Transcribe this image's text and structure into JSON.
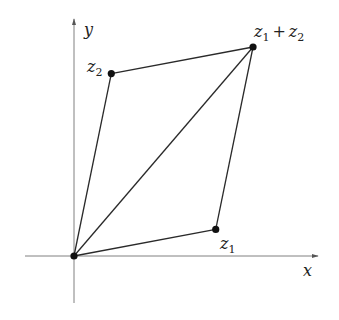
{
  "diagram": {
    "axes": {
      "x_label": "x",
      "y_label": "y"
    },
    "points": {
      "origin": {
        "name": "0",
        "coord": [
          0,
          0
        ]
      },
      "z1": {
        "base": "z",
        "sub": "1",
        "coord": [
          3.8,
          0.7
        ]
      },
      "z2": {
        "base": "z",
        "sub": "2",
        "coord": [
          1.0,
          4.8
        ]
      },
      "z1_plus_z2": {
        "base1": "z",
        "sub1": "1",
        "op": "+",
        "base2": "z",
        "sub2": "2",
        "coord": [
          4.8,
          5.5
        ]
      }
    },
    "edges": [
      {
        "from": "origin",
        "to": "z1"
      },
      {
        "from": "origin",
        "to": "z2"
      },
      {
        "from": "z1",
        "to": "z1_plus_z2"
      },
      {
        "from": "z2",
        "to": "z1_plus_z2"
      },
      {
        "from": "origin",
        "to": "z1_plus_z2"
      }
    ],
    "colors": {
      "axis": "#808080",
      "edge": "#2a2a2a",
      "point": "#111111"
    }
  }
}
